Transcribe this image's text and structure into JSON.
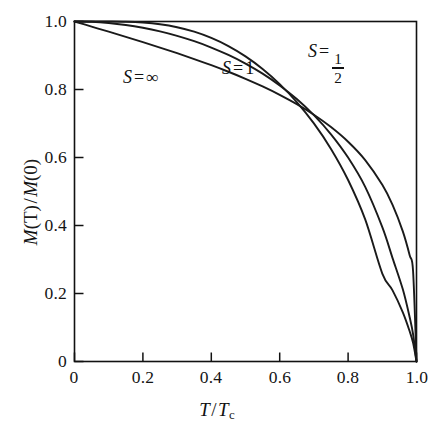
{
  "figure": {
    "name": "brillouin-magnetization-plot",
    "background_color": "#ffffff",
    "axis_color": "#111111",
    "curve_color": "#1a1a1a"
  },
  "axes": {
    "x": {
      "label_parts": {
        "var": "T",
        "slash": "/",
        "denom": "T",
        "denom_sub": "c"
      },
      "label_text": "T / Tc",
      "ticks": [
        "0",
        "0.2",
        "0.4",
        "0.6",
        "0.8",
        "1.0"
      ],
      "tick_values": [
        0,
        0.2,
        0.4,
        0.6,
        0.8,
        1.0
      ],
      "range": [
        0,
        1.0
      ]
    },
    "y": {
      "label_parts": {
        "num_var": "M",
        "num_arg": "(T)",
        "slash": "/",
        "den_var": "M",
        "den_arg": "(0)"
      },
      "label_text": "M(T) / M(0)",
      "ticks": [
        "0",
        "0.2",
        "0.4",
        "0.6",
        "0.8",
        "1.0"
      ],
      "tick_values": [
        0,
        0.2,
        0.4,
        0.6,
        0.8,
        1.0
      ],
      "range": [
        0,
        1.0
      ]
    }
  },
  "annotations": [
    {
      "id": "label-s-infinity",
      "symbol": "S",
      "equals": "=",
      "value": "∞",
      "kind": "plain",
      "x": 0.205,
      "y": 0.835
    },
    {
      "id": "label-s-one",
      "symbol": "S",
      "equals": "=",
      "value": "1",
      "kind": "plain",
      "x": 0.443,
      "y": 0.88
    },
    {
      "id": "label-s-half",
      "symbol": "S",
      "equals": "=",
      "value": "1/2",
      "kind": "fraction",
      "numerator": "1",
      "denominator": "2",
      "x": 0.7,
      "y": 0.905
    }
  ],
  "chart_data": {
    "type": "line",
    "title": "",
    "xlabel": "T / Tc",
    "ylabel": "M(T) / M(0)",
    "xlim": [
      0,
      1.0
    ],
    "ylim": [
      0,
      1.0
    ],
    "grid": false,
    "legend": "inline-annotations",
    "x": [
      0,
      0.05,
      0.1,
      0.15,
      0.2,
      0.25,
      0.3,
      0.35,
      0.4,
      0.45,
      0.5,
      0.55,
      0.6,
      0.65,
      0.7,
      0.75,
      0.8,
      0.85,
      0.9,
      0.93,
      0.96,
      0.98,
      0.99,
      1.0
    ],
    "series": [
      {
        "name": "S = 1/2",
        "values": [
          1.0,
          1.0,
          0.9999,
          0.9993,
          0.997,
          0.992,
          0.9832,
          0.97,
          0.9516,
          0.9276,
          0.8974,
          0.8604,
          0.816,
          0.7632,
          0.7004,
          0.6253,
          0.5338,
          0.4178,
          0.2587,
          0.2093,
          0.1448,
          0.089,
          0.0548,
          0.0
        ]
      },
      {
        "name": "S = 1",
        "values": [
          1.0,
          0.9993,
          0.9958,
          0.9898,
          0.9815,
          0.9709,
          0.9578,
          0.9421,
          0.9235,
          0.9016,
          0.8762,
          0.8466,
          0.8121,
          0.7719,
          0.7245,
          0.6682,
          0.5997,
          0.5135,
          0.395,
          0.3041,
          0.2122,
          0.1302,
          0.0802,
          0.0
        ]
      },
      {
        "name": "S = ∞",
        "values": [
          1.0,
          0.985,
          0.97,
          0.9548,
          0.9393,
          0.9233,
          0.9068,
          0.8896,
          0.8715,
          0.8522,
          0.8315,
          0.8091,
          0.7844,
          0.7569,
          0.7257,
          0.6894,
          0.6462,
          0.5923,
          0.5196,
          0.4605,
          0.3826,
          0.3125,
          0.2653,
          0.0
        ]
      }
    ]
  }
}
